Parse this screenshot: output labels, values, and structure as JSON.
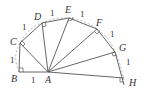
{
  "figure": {
    "points": [
      {
        "label": "A",
        "x": 48,
        "y": 72
      },
      {
        "label": "B",
        "x": 19,
        "y": 72
      },
      {
        "label": "C",
        "x": 20,
        "y": 43
      },
      {
        "label": "D",
        "x": 42,
        "y": 23
      },
      {
        "label": "E",
        "x": 69,
        "y": 18
      },
      {
        "label": "F",
        "x": 97,
        "y": 29
      },
      {
        "label": "G",
        "x": 115,
        "y": 52
      },
      {
        "label": "H",
        "x": 124,
        "y": 80
      }
    ],
    "labels": {
      "A": "A",
      "B": "B",
      "C": "C",
      "D": "D",
      "E": "E",
      "F": "F",
      "G": "G",
      "H": "H"
    },
    "edge_lengths": {
      "AB": "1",
      "BC": "1",
      "CD": "1",
      "DE": "1",
      "EF": "1",
      "FG": "1",
      "GH": "1"
    },
    "colors": {
      "line": "#555555",
      "dashed_circle": "#888888",
      "text": "#333333"
    }
  }
}
